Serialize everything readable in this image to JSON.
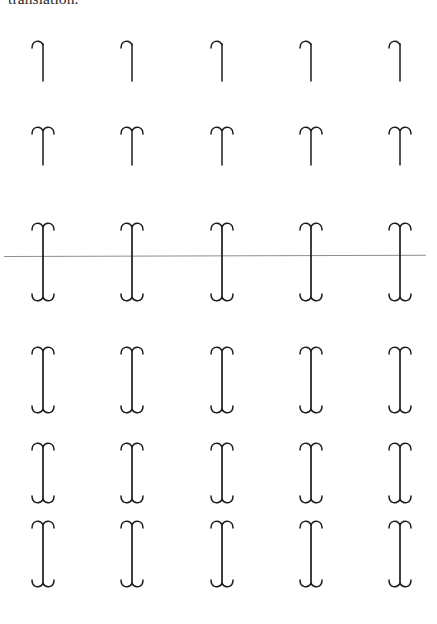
{
  "page": {
    "background_color": "#ffffff",
    "ink_color": "#1c1c1c",
    "rule_color": "#8e8e8e",
    "width": 437,
    "height": 624
  },
  "caption": {
    "text": "translation.",
    "note": "clipped at top edge of page, only descender/baseline portion visible"
  },
  "rule": {
    "name": "horizontal-ruled-line",
    "y": 256,
    "x_start": 4,
    "x_end": 426,
    "color": "#8e8e8e",
    "thickness": 1
  },
  "grid": {
    "columns": 5,
    "rows": 6,
    "column_centers": [
      43,
      132,
      222,
      311,
      400
    ],
    "row_tops": [
      36,
      122,
      218,
      342,
      438,
      516
    ],
    "row_shapes": [
      "hook",
      "top-arch",
      "full-ibeam",
      "full-ibeam",
      "full-ibeam",
      "full-ibeam"
    ],
    "row_heights": [
      48,
      46,
      88,
      76,
      70,
      76
    ],
    "cells": [
      [
        {
          "shape": "hook",
          "label": "r1c1"
        },
        {
          "shape": "hook",
          "label": "r1c2"
        },
        {
          "shape": "hook",
          "label": "r1c3"
        },
        {
          "shape": "hook",
          "label": "r1c4"
        },
        {
          "shape": "hook",
          "label": "r1c5"
        }
      ],
      [
        {
          "shape": "top-arch",
          "label": "r2c1"
        },
        {
          "shape": "top-arch",
          "label": "r2c2"
        },
        {
          "shape": "top-arch",
          "label": "r2c3"
        },
        {
          "shape": "top-arch",
          "label": "r2c4"
        },
        {
          "shape": "top-arch",
          "label": "r2c5"
        }
      ],
      [
        {
          "shape": "full-ibeam",
          "label": "r3c1"
        },
        {
          "shape": "full-ibeam",
          "label": "r3c2"
        },
        {
          "shape": "full-ibeam",
          "label": "r3c3"
        },
        {
          "shape": "full-ibeam",
          "label": "r3c4"
        },
        {
          "shape": "full-ibeam",
          "label": "r3c5"
        }
      ],
      [
        {
          "shape": "full-ibeam",
          "label": "r4c1"
        },
        {
          "shape": "full-ibeam",
          "label": "r4c2"
        },
        {
          "shape": "full-ibeam",
          "label": "r4c3"
        },
        {
          "shape": "full-ibeam",
          "label": "r4c4"
        },
        {
          "shape": "full-ibeam",
          "label": "r4c5"
        }
      ],
      [
        {
          "shape": "full-ibeam",
          "label": "r5c1"
        },
        {
          "shape": "full-ibeam",
          "label": "r5c2"
        },
        {
          "shape": "full-ibeam",
          "label": "r5c3"
        },
        {
          "shape": "full-ibeam",
          "label": "r5c4"
        },
        {
          "shape": "full-ibeam",
          "label": "r5c5"
        }
      ],
      [
        {
          "shape": "full-ibeam",
          "label": "r6c1"
        },
        {
          "shape": "full-ibeam",
          "label": "r6c2"
        },
        {
          "shape": "full-ibeam",
          "label": "r6c3"
        },
        {
          "shape": "full-ibeam",
          "label": "r6c4"
        },
        {
          "shape": "full-ibeam",
          "label": "r6c5"
        }
      ]
    ]
  }
}
